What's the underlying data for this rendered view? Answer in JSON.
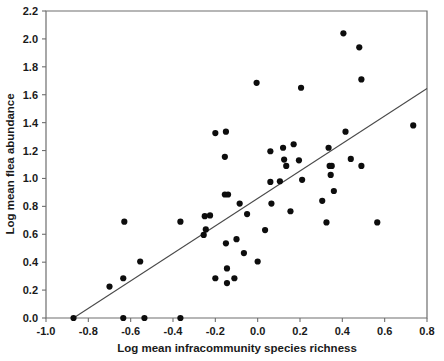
{
  "chart_data": {
    "type": "scatter",
    "title": "",
    "xlabel": "Log mean infracommunity species richness",
    "ylabel": "Log mean flea abundance",
    "xlim": [
      -1.0,
      0.8
    ],
    "ylim": [
      0.0,
      2.2
    ],
    "xticks": [
      "-1.0",
      "-0.8",
      "-0.6",
      "-0.4",
      "-0.2",
      "0.0",
      "0.2",
      "0.4",
      "0.6",
      "0.8"
    ],
    "xtick_values": [
      -1.0,
      -0.8,
      -0.6,
      -0.4,
      -0.2,
      0.0,
      0.2,
      0.4,
      0.6,
      0.8
    ],
    "yticks": [
      "0.0",
      "0.2",
      "0.4",
      "0.6",
      "0.8",
      "1.0",
      "1.2",
      "1.4",
      "1.6",
      "1.8",
      "2.0",
      "2.2"
    ],
    "ytick_values": [
      0.0,
      0.2,
      0.4,
      0.6,
      0.8,
      1.0,
      1.2,
      1.4,
      1.6,
      1.8,
      2.0,
      2.2
    ],
    "grid": false,
    "legend": false,
    "marker_color": "#0d0d0d",
    "marker_size": 3.1,
    "line_color": "#4a4a4a",
    "trend_line": {
      "type": "linear-regression",
      "x_start": -0.87,
      "y_start": 0.0,
      "x_end": 0.8,
      "y_end": 1.645
    },
    "points": [
      {
        "x": -0.87,
        "y": 0.0
      },
      {
        "x": -0.7,
        "y": 0.225
      },
      {
        "x": -0.635,
        "y": 0.0
      },
      {
        "x": -0.635,
        "y": 0.285
      },
      {
        "x": -0.63,
        "y": 0.69
      },
      {
        "x": -0.535,
        "y": 0.0
      },
      {
        "x": -0.555,
        "y": 0.405
      },
      {
        "x": -0.365,
        "y": 0.0
      },
      {
        "x": -0.365,
        "y": 0.69
      },
      {
        "x": -0.255,
        "y": 0.595
      },
      {
        "x": -0.25,
        "y": 0.73
      },
      {
        "x": -0.245,
        "y": 0.635
      },
      {
        "x": -0.225,
        "y": 0.735
      },
      {
        "x": -0.2,
        "y": 1.325
      },
      {
        "x": -0.2,
        "y": 0.285
      },
      {
        "x": -0.15,
        "y": 1.335
      },
      {
        "x": -0.155,
        "y": 1.155
      },
      {
        "x": -0.155,
        "y": 0.885
      },
      {
        "x": -0.14,
        "y": 0.885
      },
      {
        "x": -0.15,
        "y": 0.535
      },
      {
        "x": -0.145,
        "y": 0.355
      },
      {
        "x": -0.145,
        "y": 0.25
      },
      {
        "x": -0.11,
        "y": 0.285
      },
      {
        "x": -0.1,
        "y": 0.565
      },
      {
        "x": -0.085,
        "y": 0.82
      },
      {
        "x": -0.065,
        "y": 0.465
      },
      {
        "x": -0.05,
        "y": 0.745
      },
      {
        "x": -0.005,
        "y": 1.685
      },
      {
        "x": 0.0,
        "y": 0.405
      },
      {
        "x": 0.035,
        "y": 0.63
      },
      {
        "x": 0.06,
        "y": 1.195
      },
      {
        "x": 0.06,
        "y": 0.975
      },
      {
        "x": 0.065,
        "y": 0.82
      },
      {
        "x": 0.105,
        "y": 0.98
      },
      {
        "x": 0.12,
        "y": 1.22
      },
      {
        "x": 0.125,
        "y": 1.135
      },
      {
        "x": 0.135,
        "y": 1.09
      },
      {
        "x": 0.155,
        "y": 0.765
      },
      {
        "x": 0.17,
        "y": 1.245
      },
      {
        "x": 0.195,
        "y": 1.13
      },
      {
        "x": 0.205,
        "y": 1.65
      },
      {
        "x": 0.21,
        "y": 0.99
      },
      {
        "x": 0.305,
        "y": 0.84
      },
      {
        "x": 0.325,
        "y": 0.685
      },
      {
        "x": 0.335,
        "y": 1.22
      },
      {
        "x": 0.34,
        "y": 1.09
      },
      {
        "x": 0.35,
        "y": 1.09
      },
      {
        "x": 0.345,
        "y": 1.025
      },
      {
        "x": 0.36,
        "y": 0.91
      },
      {
        "x": 0.405,
        "y": 2.04
      },
      {
        "x": 0.415,
        "y": 1.335
      },
      {
        "x": 0.44,
        "y": 1.14
      },
      {
        "x": 0.48,
        "y": 1.94
      },
      {
        "x": 0.49,
        "y": 1.71
      },
      {
        "x": 0.49,
        "y": 1.09
      },
      {
        "x": 0.565,
        "y": 0.685
      },
      {
        "x": 0.735,
        "y": 1.38
      }
    ]
  }
}
